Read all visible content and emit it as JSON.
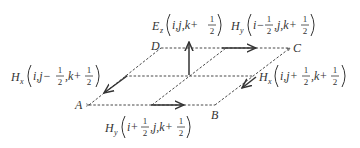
{
  "diagram": {
    "vertices": {
      "A": "A",
      "B": "B",
      "C": "C",
      "D": "D"
    },
    "labels": {
      "ez": {
        "sym": "E",
        "sub": "z",
        "args_pre": "i,j,k+",
        "frac_num": "1",
        "frac_den": "2"
      },
      "hy_top": {
        "sym": "H",
        "sub": "y",
        "args_pre": "i−",
        "frac1_num": "1",
        "frac1_den": "2",
        "args_mid": ",j,k+",
        "frac2_num": "1",
        "frac2_den": "2"
      },
      "hx_left": {
        "sym": "H",
        "sub": "x",
        "args_pre": "i,j−",
        "frac1_num": "1",
        "frac1_den": "2",
        "args_mid": ",k+",
        "frac2_num": "1",
        "frac2_den": "2"
      },
      "hx_right": {
        "sym": "H",
        "sub": "x",
        "args_pre": "i,j+",
        "frac1_num": "1",
        "frac1_den": "2",
        "args_mid": ",k+",
        "frac2_num": "1",
        "frac2_den": "2"
      },
      "hy_bottom": {
        "sym": "H",
        "sub": "y",
        "args_pre": "i+",
        "frac1_num": "1",
        "frac1_den": "2",
        "args_mid": ",j,k+",
        "frac2_num": "1",
        "frac2_den": "2"
      }
    },
    "colors": {
      "line": "#333333",
      "background": "#ffffff"
    }
  }
}
